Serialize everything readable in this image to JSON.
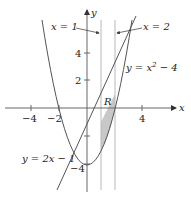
{
  "figure": {
    "type": "area-between-curves",
    "axes": {
      "x_label": "x",
      "y_label": "y",
      "x_ticks": [
        {
          "value": -4,
          "label": "−4"
        },
        {
          "value": -2,
          "label": "−2"
        },
        {
          "value": 4,
          "label": "4"
        }
      ],
      "y_ticks": [
        {
          "value": 4,
          "label": "4"
        },
        {
          "value": 2,
          "label": "2"
        },
        {
          "value": -2,
          "label": ""
        },
        {
          "value": -4,
          "label": "−4"
        }
      ]
    },
    "curves": [
      {
        "name": "parabola",
        "equation": "y = x² − 4",
        "label_main": "y = x",
        "label_sup": "2",
        "label_tail": " − 4"
      },
      {
        "name": "line",
        "equation": "y = 2x − 1",
        "label": "y = 2x − 1"
      },
      {
        "name": "vertical-left",
        "equation": "x = 1",
        "label": "x = 1"
      },
      {
        "name": "vertical-right",
        "equation": "x = 2",
        "label": "x = 2"
      }
    ],
    "region": {
      "label": "R",
      "fill": "#c8c8c8",
      "bounds": "1 ≤ x ≤ 2, x² − 4 ≤ y ≤ 2x − 1"
    },
    "colors": {
      "curve": "#555555",
      "axis": "#666666",
      "guide": "#b8b8b8",
      "region": "#c8c8c8"
    }
  }
}
